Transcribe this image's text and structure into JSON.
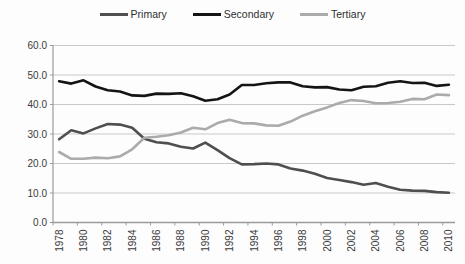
{
  "chart_data": {
    "type": "line",
    "x": [
      1978,
      1979,
      1980,
      1981,
      1982,
      1983,
      1984,
      1985,
      1986,
      1987,
      1988,
      1989,
      1990,
      1991,
      1992,
      1993,
      1994,
      1995,
      1996,
      1997,
      1998,
      1999,
      2000,
      2001,
      2002,
      2003,
      2004,
      2005,
      2006,
      2007,
      2008,
      2009,
      2010
    ],
    "series": [
      {
        "name": "Primary",
        "color": "#4f4f4f",
        "values": [
          28.2,
          31.3,
          30.2,
          31.9,
          33.4,
          33.2,
          32.1,
          28.4,
          27.2,
          26.8,
          25.7,
          25.1,
          27.1,
          24.5,
          21.8,
          19.7,
          19.8,
          20.0,
          19.7,
          18.3,
          17.6,
          16.5,
          15.1,
          14.4,
          13.7,
          12.8,
          13.4,
          12.1,
          11.1,
          10.8,
          10.7,
          10.3,
          10.1
        ]
      },
      {
        "name": "Secondary",
        "color": "#141414",
        "values": [
          47.9,
          47.1,
          48.2,
          46.1,
          44.8,
          44.4,
          43.1,
          42.9,
          43.7,
          43.6,
          43.8,
          42.8,
          41.3,
          41.8,
          43.4,
          46.6,
          46.6,
          47.2,
          47.5,
          47.5,
          46.2,
          45.8,
          45.9,
          45.1,
          44.8,
          46.0,
          46.2,
          47.4,
          47.9,
          47.3,
          47.4,
          46.3,
          46.7
        ]
      },
      {
        "name": "Tertiary",
        "color": "#ababab",
        "values": [
          23.9,
          21.6,
          21.6,
          22.0,
          21.8,
          22.4,
          24.8,
          28.7,
          29.1,
          29.6,
          30.5,
          32.1,
          31.6,
          33.7,
          34.8,
          33.7,
          33.6,
          32.9,
          32.8,
          34.2,
          36.2,
          37.7,
          39.0,
          40.5,
          41.5,
          41.2,
          40.4,
          40.5,
          40.9,
          41.9,
          41.8,
          43.4,
          43.2
        ]
      }
    ],
    "title": "",
    "xlabel": "",
    "ylabel": "",
    "ylim": [
      0,
      60
    ],
    "ytick_step": 10,
    "ytick_labels": [
      "0.0",
      "10.0",
      "20.0",
      "30.0",
      "40.0",
      "50.0",
      "60.0"
    ],
    "xtick_labels": [
      "1978",
      "1980",
      "1982",
      "1984",
      "1986",
      "1988",
      "1990",
      "1992",
      "1994",
      "1996",
      "1998",
      "2000",
      "2002",
      "2004",
      "2006",
      "2008",
      "2010"
    ],
    "grid": true,
    "legend_position": "top"
  },
  "style": {
    "gridline_color": "#c9c9c9",
    "axis_color": "#9b9b9b",
    "tick_text_color": "#3a3a3a",
    "background": "#fdfdfd"
  }
}
